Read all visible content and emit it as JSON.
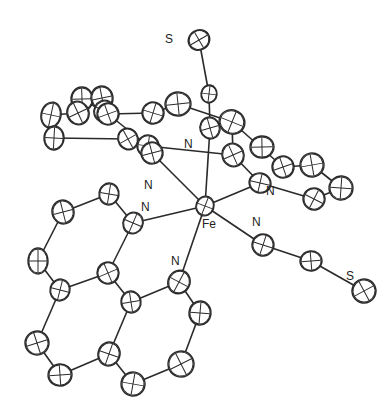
{
  "figure": {
    "type": "ORTEP molecular structure",
    "labels": [
      {
        "id": "S1",
        "text": "S",
        "x": 165,
        "y": 43
      },
      {
        "id": "N_top",
        "text": "N",
        "x": 184,
        "y": 148
      },
      {
        "id": "N_ul",
        "text": "N",
        "x": 144,
        "y": 189
      },
      {
        "id": "N_ur",
        "text": "N",
        "x": 266,
        "y": 195
      },
      {
        "id": "N_l",
        "text": "N",
        "x": 141,
        "y": 211
      },
      {
        "id": "Fe",
        "text": "Fe",
        "x": 202,
        "y": 228
      },
      {
        "id": "N_r",
        "text": "N",
        "x": 252,
        "y": 226
      },
      {
        "id": "N_ll",
        "text": "N",
        "x": 171,
        "y": 265
      },
      {
        "id": "S2",
        "text": "S",
        "x": 346,
        "y": 280
      }
    ],
    "atoms": [
      {
        "id": "S1",
        "x": 199,
        "y": 40,
        "rx": 11,
        "ry": 10
      },
      {
        "id": "C_top",
        "x": 209,
        "y": 94,
        "rx": 8,
        "ry": 9
      },
      {
        "id": "N_top",
        "x": 210,
        "y": 128,
        "rx": 10,
        "ry": 11
      },
      {
        "id": "Fe",
        "x": 205,
        "y": 206,
        "rx": 9,
        "ry": 10
      },
      {
        "id": "u1",
        "x": 82,
        "y": 99,
        "rx": 11,
        "ry": 12
      },
      {
        "id": "u2",
        "x": 78,
        "y": 113,
        "rx": 11,
        "ry": 12
      },
      {
        "id": "u3",
        "x": 51,
        "y": 115,
        "rx": 10,
        "ry": 13
      },
      {
        "id": "u4",
        "x": 102,
        "y": 98,
        "rx": 11,
        "ry": 12
      },
      {
        "id": "u5",
        "x": 104,
        "y": 111,
        "rx": 10,
        "ry": 11
      },
      {
        "id": "u6",
        "x": 54,
        "y": 138,
        "rx": 10,
        "ry": 12
      },
      {
        "id": "u7",
        "x": 108,
        "y": 114,
        "rx": 11,
        "ry": 11
      },
      {
        "id": "u8",
        "x": 153,
        "y": 113,
        "rx": 11,
        "ry": 11
      },
      {
        "id": "u9",
        "x": 178,
        "y": 104,
        "rx": 13,
        "ry": 12
      },
      {
        "id": "u10",
        "x": 128,
        "y": 139,
        "rx": 10,
        "ry": 11
      },
      {
        "id": "u11",
        "x": 148,
        "y": 146,
        "rx": 11,
        "ry": 11
      },
      {
        "id": "u12",
        "x": 152,
        "y": 153,
        "rx": 11,
        "ry": 11
      },
      {
        "id": "u13",
        "x": 232,
        "y": 122,
        "rx": 13,
        "ry": 12
      },
      {
        "id": "u14",
        "x": 262,
        "y": 147,
        "rx": 12,
        "ry": 11
      },
      {
        "id": "u15",
        "x": 233,
        "y": 155,
        "rx": 11,
        "ry": 12
      },
      {
        "id": "u16",
        "x": 260,
        "y": 183,
        "rx": 11,
        "ry": 10
      },
      {
        "id": "u17",
        "x": 312,
        "y": 165,
        "rx": 12,
        "ry": 12
      },
      {
        "id": "u18",
        "x": 314,
        "y": 199,
        "rx": 11,
        "ry": 11
      },
      {
        "id": "u19",
        "x": 341,
        "y": 188,
        "rx": 12,
        "ry": 12
      },
      {
        "id": "u20",
        "x": 283,
        "y": 167,
        "rx": 11,
        "ry": 11
      },
      {
        "id": "N_r",
        "x": 263,
        "y": 245,
        "rx": 11,
        "ry": 11
      },
      {
        "id": "C_r",
        "x": 311,
        "y": 261,
        "rx": 11,
        "ry": 10
      },
      {
        "id": "S2",
        "x": 364,
        "y": 291,
        "rx": 12,
        "ry": 12
      },
      {
        "id": "l1",
        "x": 109,
        "y": 194,
        "rx": 10,
        "ry": 11
      },
      {
        "id": "l2",
        "x": 63,
        "y": 212,
        "rx": 11,
        "ry": 12
      },
      {
        "id": "l3",
        "x": 133,
        "y": 223,
        "rx": 10,
        "ry": 11
      },
      {
        "id": "l4",
        "x": 38,
        "y": 261,
        "rx": 10,
        "ry": 13
      },
      {
        "id": "l5",
        "x": 108,
        "y": 273,
        "rx": 11,
        "ry": 11
      },
      {
        "id": "l6",
        "x": 60,
        "y": 290,
        "rx": 10,
        "ry": 11
      },
      {
        "id": "l7",
        "x": 131,
        "y": 302,
        "rx": 10,
        "ry": 11
      },
      {
        "id": "l8",
        "x": 179,
        "y": 282,
        "rx": 11,
        "ry": 12
      },
      {
        "id": "l9",
        "x": 200,
        "y": 313,
        "rx": 11,
        "ry": 12
      },
      {
        "id": "l10",
        "x": 37,
        "y": 343,
        "rx": 12,
        "ry": 12
      },
      {
        "id": "l11",
        "x": 109,
        "y": 354,
        "rx": 11,
        "ry": 12
      },
      {
        "id": "l12",
        "x": 60,
        "y": 375,
        "rx": 12,
        "ry": 11
      },
      {
        "id": "l13",
        "x": 181,
        "y": 364,
        "rx": 13,
        "ry": 13
      },
      {
        "id": "l14",
        "x": 133,
        "y": 384,
        "rx": 12,
        "ry": 12
      }
    ],
    "bonds": [
      [
        "S1",
        "C_top"
      ],
      [
        "C_top",
        "N_top"
      ],
      [
        "N_top",
        "Fe"
      ],
      [
        "Fe",
        "u12"
      ],
      [
        "Fe",
        "u16"
      ],
      [
        "Fe",
        "N_r"
      ],
      [
        "Fe",
        "l3"
      ],
      [
        "Fe",
        "l8"
      ],
      [
        "N_r",
        "C_r"
      ],
      [
        "C_r",
        "S2"
      ],
      [
        "u3",
        "u2"
      ],
      [
        "u2",
        "u1"
      ],
      [
        "u3",
        "u6"
      ],
      [
        "u6",
        "u10"
      ],
      [
        "u10",
        "u12"
      ],
      [
        "u1",
        "u7"
      ],
      [
        "u7",
        "u8"
      ],
      [
        "u7",
        "u11"
      ],
      [
        "u11",
        "u12"
      ],
      [
        "u8",
        "u9"
      ],
      [
        "u9",
        "u13"
      ],
      [
        "u11",
        "u15"
      ],
      [
        "u15",
        "u16"
      ],
      [
        "u13",
        "u15"
      ],
      [
        "u13",
        "u20"
      ],
      [
        "u20",
        "u17"
      ],
      [
        "u17",
        "u19"
      ],
      [
        "u19",
        "u18"
      ],
      [
        "u18",
        "u16"
      ],
      [
        "l1",
        "l2"
      ],
      [
        "l1",
        "l3"
      ],
      [
        "l2",
        "l4"
      ],
      [
        "l4",
        "l6"
      ],
      [
        "l6",
        "l5"
      ],
      [
        "l5",
        "l3"
      ],
      [
        "l5",
        "l7"
      ],
      [
        "l7",
        "l8"
      ],
      [
        "l6",
        "l10"
      ],
      [
        "l10",
        "l12"
      ],
      [
        "l12",
        "l11"
      ],
      [
        "l11",
        "l7"
      ],
      [
        "l11",
        "l14"
      ],
      [
        "l14",
        "l13"
      ],
      [
        "l13",
        "l9"
      ],
      [
        "l9",
        "l8"
      ]
    ]
  }
}
